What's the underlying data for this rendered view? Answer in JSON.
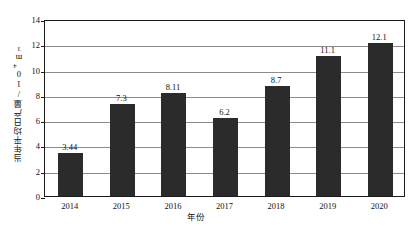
{
  "chart_data": {
    "type": "bar",
    "title": "",
    "xlabel": "年份",
    "ylabel": "当年平均日产量/10⁴m³",
    "ylabel_main": "当年平均日产量/10",
    "ylabel_sup": "4",
    "ylabel_unit": "m³",
    "categories": [
      "2014",
      "2015",
      "2016",
      "2017",
      "2018",
      "2019",
      "2020"
    ],
    "values": [
      3.44,
      7.3,
      8.11,
      6.2,
      8.7,
      11.1,
      12.1
    ],
    "value_labels": [
      "3.44",
      "7.3",
      "8.11",
      "6.2",
      "8.7",
      "11.1",
      "12.1"
    ],
    "ylim": [
      0,
      14
    ],
    "yticks": [
      0,
      2,
      4,
      6,
      8,
      10,
      12,
      14
    ],
    "ytick_labels": [
      "0",
      "2",
      "4",
      "6",
      "8",
      "10",
      "12",
      "14"
    ],
    "grid": true,
    "legend": "none",
    "bar_color": "#2b2b2b",
    "grid_color": "#8c8c8c",
    "frame_color": "#1a1a1a",
    "background": "#ffffff"
  }
}
